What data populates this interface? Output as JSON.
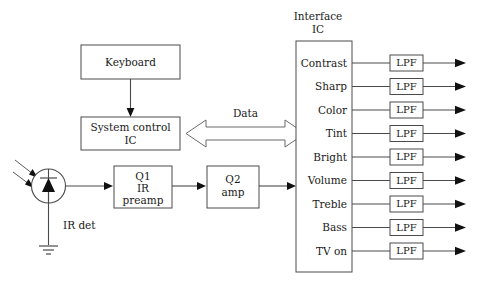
{
  "diagram": {
    "background_color": "#ffffff",
    "line_color": "#4a4a4a",
    "text_color": "#1a1a1a",
    "arrow_color": "#111111"
  },
  "blocks": {
    "keyboard": {
      "label": "Keyboard"
    },
    "system_control": {
      "line1": "System control",
      "line2": "IC"
    },
    "q1": {
      "line1": "Q1",
      "line2": "IR",
      "line3": "preamp"
    },
    "q2": {
      "line1": "Q2",
      "line2": "amp"
    },
    "interface_ic": {
      "title_line1": "Interface",
      "title_line2": "IC"
    }
  },
  "bus": {
    "label": "Data"
  },
  "detector": {
    "label": "IR det",
    "symbol": "photodiode"
  },
  "outputs": {
    "filter_label": "LPF",
    "rows": [
      {
        "name": "Contrast"
      },
      {
        "name": "Sharp"
      },
      {
        "name": "Color"
      },
      {
        "name": "Tint"
      },
      {
        "name": "Bright"
      },
      {
        "name": "Volume"
      },
      {
        "name": "Treble"
      },
      {
        "name": "Bass"
      },
      {
        "name": "TV on"
      }
    ]
  }
}
